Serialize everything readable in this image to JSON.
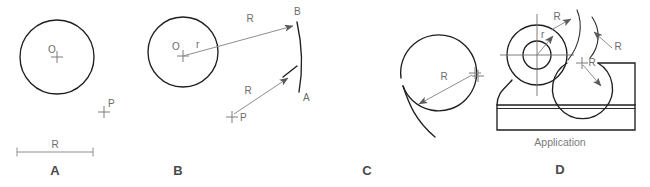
{
  "figure": {
    "colors": {
      "object_line": "#1f1f1f",
      "leader_line": "#8e8e8e",
      "text": "#6b6b6b",
      "panel_letter": "#4a4a4a",
      "background": "#ffffff"
    },
    "panels": [
      {
        "id": "A",
        "letter": "A",
        "labels": {
          "center": "O",
          "point": "P",
          "radius": "R"
        }
      },
      {
        "id": "B",
        "letter": "B",
        "labels": {
          "center": "O",
          "small_radius": "r",
          "radius_top": "R",
          "radius_bottom": "R",
          "point": "P",
          "arc_end_top": "B",
          "arc_end_bottom": "A"
        }
      },
      {
        "id": "C",
        "letter": "C",
        "labels": {
          "radius": "R"
        }
      },
      {
        "id": "D",
        "letter": "D",
        "caption": "Application",
        "labels": {
          "small_radius": "r",
          "radius_1": "R",
          "radius_2": "R",
          "radius_3": "R"
        }
      }
    ]
  }
}
